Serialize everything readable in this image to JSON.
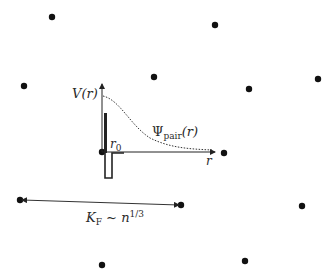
{
  "labels": {
    "potential": "V(r)",
    "pair_wavefunction": "Ψ",
    "pair_sub": "pair",
    "pair_arg": "(r)",
    "range": "r",
    "range_sub": "0",
    "r_axis": "r",
    "fermi_main": "K",
    "fermi_sub": "F",
    "fermi_rel": " ~ n",
    "fermi_sup": "1/3"
  },
  "colors": {
    "dot": "#111111",
    "line": "#222222",
    "text": "#2a2a2a"
  },
  "particles": [
    {
      "x": 52,
      "y": 17
    },
    {
      "x": 215,
      "y": 25
    },
    {
      "x": 24,
      "y": 86
    },
    {
      "x": 154,
      "y": 77
    },
    {
      "x": 249,
      "y": 89
    },
    {
      "x": 318,
      "y": 79
    },
    {
      "x": 102,
      "y": 152
    },
    {
      "x": 224,
      "y": 153
    },
    {
      "x": 20,
      "y": 200
    },
    {
      "x": 181,
      "y": 205
    },
    {
      "x": 302,
      "y": 206
    },
    {
      "x": 102,
      "y": 265
    },
    {
      "x": 245,
      "y": 261
    }
  ]
}
